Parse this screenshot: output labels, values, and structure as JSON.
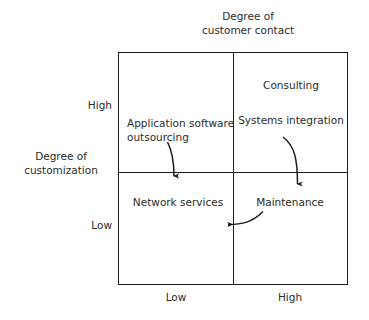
{
  "diagram": {
    "type": "two-by-two-matrix",
    "x_axis": {
      "title": "Degree of\ncustomer contact",
      "ticks": {
        "left": "Low",
        "right": "High"
      }
    },
    "y_axis": {
      "title": "Degree of\ncustomization",
      "ticks": {
        "top": "High",
        "bottom": "Low"
      }
    },
    "quadrants": {
      "top_left": "Application software\noutsourcing",
      "top_right_primary": "Consulting",
      "top_right_secondary": "Systems integration",
      "bottom_left": "Network services",
      "bottom_right": "Maintenance"
    },
    "arrows": [
      {
        "name": "arrow-outsourcing-to-network-services",
        "from": "Application software outsourcing",
        "to": "Network services"
      },
      {
        "name": "arrow-systems-integration-to-maintenance",
        "from": "Systems integration",
        "to": "Maintenance"
      },
      {
        "name": "arrow-maintenance-to-network-services",
        "from": "Maintenance",
        "to": "Network services"
      }
    ],
    "colors": {
      "line": "#1a1a1a",
      "text": "#2b2b2b",
      "background": "#ffffff"
    }
  }
}
